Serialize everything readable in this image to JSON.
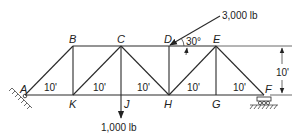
{
  "diagram": {
    "type": "truss",
    "nodes": {
      "A": "A",
      "B": "B",
      "C": "C",
      "D": "D",
      "E": "E",
      "F": "F",
      "G": "G",
      "H": "H",
      "J": "J",
      "K": "K"
    },
    "panel_lengths": [
      "10'",
      "10'",
      "10'",
      "10'",
      "10'"
    ],
    "height_dimension": "10'",
    "loads": {
      "vertical": "1,000 lb",
      "inclined": "3,000 lb",
      "inclined_angle": "30°"
    },
    "supports": {
      "left": "pin-support-icon",
      "right": "roller-support-icon"
    }
  }
}
